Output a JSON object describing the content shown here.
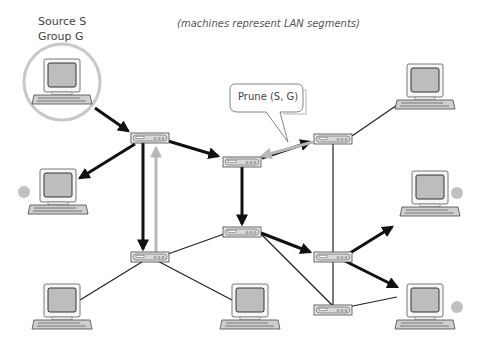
{
  "source_label": {
    "line1": "Source S",
    "line2": "Group G"
  },
  "caption": "(machines represent LAN segments)",
  "prune_bubble": {
    "text": "Prune (S, G)"
  },
  "colors": {
    "arrow_forward": "#111111",
    "arrow_prune": "#b8b8b8",
    "link": "#222222",
    "highlight_circle": "#c8c8c8",
    "no_member_dot": "#c0c0c0",
    "screen": "#bdbdbd"
  },
  "routers": [
    {
      "id": "R1",
      "x": 150,
      "y": 138
    },
    {
      "id": "R2",
      "x": 242,
      "y": 162
    },
    {
      "id": "R3",
      "x": 333,
      "y": 139
    },
    {
      "id": "R4",
      "x": 242,
      "y": 232
    },
    {
      "id": "R5",
      "x": 150,
      "y": 257
    },
    {
      "id": "R6",
      "x": 333,
      "y": 257
    },
    {
      "id": "R7",
      "x": 333,
      "y": 310
    }
  ],
  "hosts": [
    {
      "id": "source",
      "x": 62,
      "y": 85,
      "note": "source"
    },
    {
      "id": "left-middle",
      "x": 58,
      "y": 195,
      "member": false
    },
    {
      "id": "top-right",
      "x": 425,
      "y": 90,
      "member": true
    },
    {
      "id": "right-middle",
      "x": 430,
      "y": 197,
      "member": false
    },
    {
      "id": "bottom-left",
      "x": 62,
      "y": 310,
      "member": true
    },
    {
      "id": "bottom-center",
      "x": 250,
      "y": 310,
      "member": true
    },
    {
      "id": "bottom-right",
      "x": 425,
      "y": 310,
      "member": false
    }
  ]
}
